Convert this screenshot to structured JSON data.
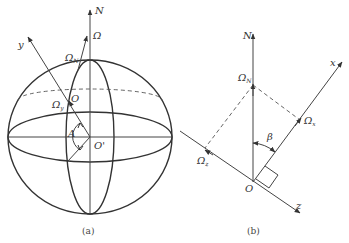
{
  "figure_a": {
    "caption": "(a)",
    "labels": {
      "north": "N",
      "omega": "Ω",
      "omega_n": "Ω",
      "omega_n_sub": "N",
      "omega_y": "Ω",
      "omega_y_sub": "y",
      "point_o": "O",
      "center": "O'",
      "angle_a": "A",
      "axis_y": "y"
    }
  },
  "figure_b": {
    "caption": "(b)",
    "labels": {
      "north": "N",
      "omega_n": "Ω",
      "omega_n_sub": "N",
      "omega_x": "Ω",
      "omega_x_sub": "x",
      "omega_z": "Ω",
      "omega_z_sub": "z",
      "angle_beta": "β",
      "origin": "O",
      "axis_x": "x",
      "axis_z": "z"
    }
  },
  "colors": {
    "line": "#333333",
    "background": "#ffffff"
  }
}
